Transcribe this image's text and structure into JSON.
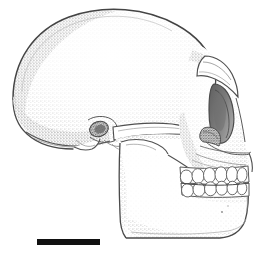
{
  "figure": {
    "title": "Hominid cranium, left lateral view",
    "view": "left lateral",
    "medium": "stipple pen-and-ink scientific illustration",
    "background_color": "#ffffff",
    "outline_color": "#3a3a3a",
    "stipple_color": "#8d8d8d",
    "shadow_color": "#b9b9b9",
    "canvas": {
      "width": 258,
      "height": 259
    }
  },
  "scale_bar": {
    "name": "scale-bar",
    "label": "",
    "color": "#111111",
    "x": 37,
    "y": 239,
    "width": 63,
    "height": 6
  },
  "anatomy": {
    "parts": [
      {
        "id": "cranial-vault",
        "label": "Cranial vault (neurocranium)",
        "shading": "light stipple"
      },
      {
        "id": "frontal-bone",
        "label": "Frontal bone",
        "shading": "light stipple"
      },
      {
        "id": "supraorbital-torus",
        "label": "Supraorbital torus (brow ridge)",
        "shading": "medium stipple"
      },
      {
        "id": "orbit",
        "label": "Orbit (eye socket)",
        "shading": "dark stipple"
      },
      {
        "id": "nasal-aperture",
        "label": "Nasal aperture",
        "shading": "dark stipple"
      },
      {
        "id": "zygomatic-arch",
        "label": "Zygomatic arch",
        "shading": "medium stipple"
      },
      {
        "id": "external-auditory-meatus",
        "label": "External auditory meatus (ear canal)",
        "shading": "dark stipple"
      },
      {
        "id": "mastoid-process",
        "label": "Mastoid process",
        "shading": "medium stipple"
      },
      {
        "id": "occipital-bone",
        "label": "Occipital bone",
        "shading": "medium stipple"
      },
      {
        "id": "maxilla",
        "label": "Maxilla",
        "shading": "light stipple"
      },
      {
        "id": "mandible-ramus",
        "label": "Mandibular ramus",
        "shading": "light stipple"
      },
      {
        "id": "mandible-body",
        "label": "Mandibular body",
        "shading": "light stipple"
      },
      {
        "id": "upper-teeth",
        "label": "Upper tooth row (maxillary)",
        "count": 6
      },
      {
        "id": "lower-teeth",
        "label": "Lower tooth row (mandibular)",
        "count": 6
      }
    ]
  },
  "teeth": {
    "upper": [
      {
        "x": 186.5,
        "y": 177.0,
        "rx": 6.2,
        "ry": 7.0,
        "rot": -6
      },
      {
        "x": 198.0,
        "y": 176.0,
        "rx": 6.0,
        "ry": 7.4,
        "rot": -4
      },
      {
        "x": 209.5,
        "y": 175.2,
        "rx": 6.0,
        "ry": 7.6,
        "rot": -2
      },
      {
        "x": 221.0,
        "y": 174.6,
        "rx": 6.0,
        "ry": 7.8,
        "rot": 0
      },
      {
        "x": 232.0,
        "y": 174.4,
        "rx": 5.6,
        "ry": 7.8,
        "rot": 2
      },
      {
        "x": 242.0,
        "y": 175.0,
        "rx": 5.0,
        "ry": 7.4,
        "rot": 4
      }
    ],
    "lower": [
      {
        "x": 187.5,
        "y": 190.4,
        "rx": 6.0,
        "ry": 6.6,
        "rot": -6
      },
      {
        "x": 199.0,
        "y": 189.6,
        "rx": 6.0,
        "ry": 6.8,
        "rot": -4
      },
      {
        "x": 210.5,
        "y": 188.8,
        "rx": 6.0,
        "ry": 7.0,
        "rot": -2
      },
      {
        "x": 221.8,
        "y": 188.2,
        "rx": 5.8,
        "ry": 7.0,
        "rot": 0
      },
      {
        "x": 232.4,
        "y": 188.0,
        "rx": 5.4,
        "ry": 6.8,
        "rot": 2
      },
      {
        "x": 242.0,
        "y": 188.4,
        "rx": 4.8,
        "ry": 6.4,
        "rot": 4
      }
    ]
  }
}
